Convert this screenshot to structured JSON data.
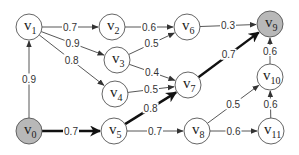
{
  "diagram": {
    "type": "directed-weighted-graph",
    "highlight_color": "#111111",
    "shaded_node_color": "#b8b8b8",
    "nodes": [
      {
        "id": "v0",
        "base": "v",
        "sub": "0",
        "x": 29,
        "y": 131,
        "shaded": true
      },
      {
        "id": "v1",
        "base": "v",
        "sub": "1",
        "x": 29,
        "y": 27,
        "shaded": false
      },
      {
        "id": "v2",
        "base": "v",
        "sub": "2",
        "x": 112,
        "y": 27,
        "shaded": false
      },
      {
        "id": "v3",
        "base": "v",
        "sub": "3",
        "x": 117,
        "y": 60,
        "shaded": false
      },
      {
        "id": "v4",
        "base": "v",
        "sub": "4",
        "x": 115,
        "y": 94,
        "shaded": false
      },
      {
        "id": "v5",
        "base": "v",
        "sub": "5",
        "x": 114,
        "y": 131,
        "shaded": false
      },
      {
        "id": "v6",
        "base": "v",
        "sub": "6",
        "x": 187,
        "y": 27,
        "shaded": false
      },
      {
        "id": "v7",
        "base": "v",
        "sub": "7",
        "x": 188,
        "y": 85,
        "shaded": false
      },
      {
        "id": "v8",
        "base": "v",
        "sub": "8",
        "x": 197,
        "y": 131,
        "shaded": false
      },
      {
        "id": "v9",
        "base": "v",
        "sub": "9",
        "x": 270,
        "y": 24,
        "shaded": true
      },
      {
        "id": "v10",
        "base": "v",
        "sub": "10",
        "x": 270,
        "y": 77,
        "shaded": false
      },
      {
        "id": "v11",
        "base": "v",
        "sub": "11",
        "x": 271,
        "y": 131,
        "shaded": false
      }
    ],
    "edges": [
      {
        "from": "v0",
        "to": "v1",
        "weight": "0.9",
        "bold": false
      },
      {
        "from": "v1",
        "to": "v2",
        "weight": "0.7",
        "bold": false
      },
      {
        "from": "v1",
        "to": "v3",
        "weight": "0.9",
        "bold": false
      },
      {
        "from": "v1",
        "to": "v4",
        "weight": "0.8",
        "bold": false
      },
      {
        "from": "v2",
        "to": "v6",
        "weight": "0.6",
        "bold": false
      },
      {
        "from": "v3",
        "to": "v6",
        "weight": "0.5",
        "bold": false
      },
      {
        "from": "v3",
        "to": "v7",
        "weight": "0.4",
        "bold": false
      },
      {
        "from": "v4",
        "to": "v7",
        "weight": "0.5",
        "bold": false
      },
      {
        "from": "v6",
        "to": "v9",
        "weight": "0.3",
        "bold": false
      },
      {
        "from": "v0",
        "to": "v5",
        "weight": "0.7",
        "bold": true
      },
      {
        "from": "v5",
        "to": "v7",
        "weight": "0.8",
        "bold": true
      },
      {
        "from": "v7",
        "to": "v9",
        "weight": "0.7",
        "bold": true
      },
      {
        "from": "v5",
        "to": "v8",
        "weight": "0.7",
        "bold": false
      },
      {
        "from": "v8",
        "to": "v10",
        "weight": "0.5",
        "bold": false
      },
      {
        "from": "v8",
        "to": "v11",
        "weight": "0.6",
        "bold": false
      },
      {
        "from": "v11",
        "to": "v10",
        "weight": "0.6",
        "bold": false
      },
      {
        "from": "v10",
        "to": "v9",
        "weight": "0.6",
        "bold": false
      }
    ]
  }
}
